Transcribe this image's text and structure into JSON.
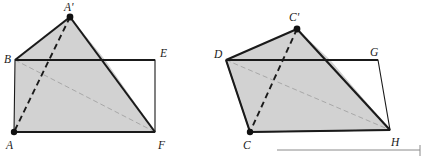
{
  "figure": {
    "background_color": "#ffffff",
    "shade_color": "#d2d2d2",
    "stroke_color": "#1a1a1a",
    "hidden_edge_color": "#9a9a9a",
    "dashed_edge_color": "#1a1a1a"
  },
  "left_figure": {
    "name": "rectangle-with-folded-apex",
    "vertices": {
      "A": {
        "label": "A",
        "x": 14,
        "y": 132,
        "label_x": 6,
        "label_y": 149,
        "dot": true
      },
      "B": {
        "label": "B",
        "x": 15,
        "y": 60,
        "label_x": 4,
        "label_y": 63,
        "dot": false
      },
      "E": {
        "label": "E",
        "x": 155,
        "y": 60,
        "label_x": 160,
        "label_y": 57,
        "dot": false
      },
      "F": {
        "label": "F",
        "x": 155,
        "y": 132,
        "label_x": 158,
        "label_y": 149,
        "dot": false
      },
      "Aprime": {
        "label": "A'",
        "x": 70,
        "y": 17,
        "label_x": 64,
        "label_y": 11,
        "dot": true
      }
    }
  },
  "right_figure": {
    "name": "parallelogram-with-folded-apex",
    "vertices": {
      "C": {
        "label": "C",
        "x": 250,
        "y": 132,
        "label_x": 243,
        "label_y": 149,
        "dot": true
      },
      "D": {
        "label": "D",
        "x": 226,
        "y": 60,
        "label_x": 214,
        "label_y": 58,
        "dot": false
      },
      "G": {
        "label": "G",
        "x": 378,
        "y": 60,
        "label_x": 370,
        "label_y": 56,
        "dot": false
      },
      "H": {
        "label": "H",
        "x": 390,
        "y": 130,
        "label_x": 391,
        "label_y": 146,
        "dot": false
      },
      "Cprime": {
        "label": "C'",
        "x": 297,
        "y": 29,
        "label_x": 289,
        "label_y": 21,
        "dot": true
      }
    },
    "baseline_rule": {
      "name": "measurement-rule",
      "x1": 277,
      "x2": 420,
      "y": 150
    }
  }
}
